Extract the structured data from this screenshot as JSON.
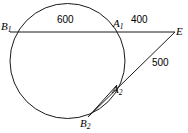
{
  "figure": {
    "type": "circle-secant-diagram",
    "background_color": "#ffffff",
    "stroke_color": "#1a1a1a",
    "width": 188,
    "height": 133
  },
  "circle": {
    "center_x": 67.5,
    "center_y": 61,
    "radius": 57.5
  },
  "points": {
    "B1": {
      "label": "B",
      "sub": "1",
      "x": 10,
      "y": 32,
      "label_x": 1,
      "label_y": 21
    },
    "A1": {
      "label": "A",
      "sub": "1",
      "x": 118,
      "y": 32,
      "label_x": 113,
      "label_y": 18
    },
    "E": {
      "label": "E",
      "sub": "",
      "x": 175,
      "y": 32,
      "label_x": 176,
      "label_y": 26
    },
    "A2": {
      "label": "A",
      "sub": "2",
      "x": 117,
      "y": 85,
      "label_x": 112,
      "label_y": 84
    },
    "B2": {
      "label": "B",
      "sub": "2",
      "x": 88,
      "y": 117,
      "label_x": 80,
      "label_y": 118
    }
  },
  "segments": [
    {
      "name": "B1-to-E",
      "from": "B1",
      "to": "E"
    },
    {
      "name": "B2-to-E",
      "from": "B2",
      "to": "E"
    },
    {
      "name": "B2-to-A2-chord",
      "from": "B2",
      "to": "A2"
    }
  ],
  "measurements": {
    "B1_A1": {
      "value": "600",
      "x": 57,
      "y": 15
    },
    "A1_E": {
      "value": "400",
      "x": 131,
      "y": 15
    },
    "A2_E": {
      "value": "500",
      "x": 152,
      "y": 58
    }
  }
}
